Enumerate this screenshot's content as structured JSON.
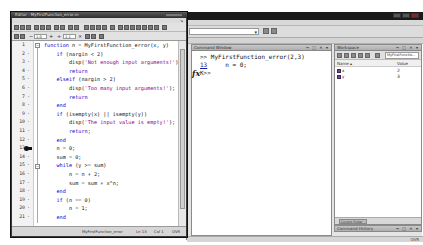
{
  "main_window": {
    "current_folder_placeholder": "",
    "command_window": {
      "title": "Command Window",
      "controls": "→ □ ✕ ▾",
      "lines": [
        {
          "prompt": ">> ",
          "text": "MyFirstFunction_error(2,3)"
        },
        {
          "link": "13",
          "text": "     n = 0;"
        },
        {
          "prompt": "K>>",
          "text": ""
        }
      ],
      "fx_label": "fx"
    },
    "workspace": {
      "title": "Workspace",
      "controls": "→ □ ✕ ▾",
      "stack_selector": "MyFirstFunctio...",
      "columns": {
        "name": "Name ▴",
        "value": "Value"
      },
      "variables": [
        {
          "name": "x",
          "value": "2"
        },
        {
          "name": "y",
          "value": "3"
        }
      ],
      "bottom_tab": "Current Folder"
    },
    "command_history": {
      "title": "Command History",
      "controls": "→ □ ✕ ▾"
    },
    "status": {
      "mode": "OVR"
    }
  },
  "editor": {
    "title": "Editor - MyFirstFunction_error.m",
    "menu": [
      "File",
      "Edit",
      "Text",
      "Go",
      "Cell",
      "Tools",
      "Debug",
      "Desktop",
      "Window",
      "Help"
    ],
    "cell_toolbar": {
      "minus": "−",
      "value1": "1.0",
      "plus": "+",
      "divide": "÷",
      "value2": "1.1",
      "times": "×"
    },
    "lines": [
      {
        "n": "1",
        "dash": "",
        "code": "function n = MyFirstFunction_error(x, y)"
      },
      {
        "n": "2",
        "dash": "-",
        "code": "    if (nargin < 2)"
      },
      {
        "n": "3",
        "dash": "-",
        "code": "        disp('Not enough input arguments!')"
      },
      {
        "n": "4",
        "dash": "-",
        "code": "        return"
      },
      {
        "n": "5",
        "dash": "-",
        "code": "    elseif (nargin > 2)"
      },
      {
        "n": "6",
        "dash": "-",
        "code": "        disp('Too many input arguments!');"
      },
      {
        "n": "7",
        "dash": "-",
        "code": "        return"
      },
      {
        "n": "8",
        "dash": "-",
        "code": "    end"
      },
      {
        "n": "9",
        "dash": "-",
        "code": "    if (isempty(x) || isempty(y))"
      },
      {
        "n": "10",
        "dash": "-",
        "code": "        disp('The input value is empty!');"
      },
      {
        "n": "11",
        "dash": "-",
        "code": "        return;"
      },
      {
        "n": "12",
        "dash": "-",
        "code": "    end"
      },
      {
        "n": "13",
        "dash": "",
        "code": "    n = 0;"
      },
      {
        "n": "14",
        "dash": "-",
        "code": "    sum = 0;"
      },
      {
        "n": "15",
        "dash": "-",
        "code": "    while (y >= sum)"
      },
      {
        "n": "16",
        "dash": "-",
        "code": "        n = n + 2;"
      },
      {
        "n": "17",
        "dash": "-",
        "code": "        sum = sum + x^n;"
      },
      {
        "n": "18",
        "dash": "-",
        "code": "    end"
      },
      {
        "n": "19",
        "dash": "-",
        "code": "    if (n == 0)"
      },
      {
        "n": "20",
        "dash": "-",
        "code": "        n = 1;"
      },
      {
        "n": "21",
        "dash": "-",
        "code": "    end"
      }
    ],
    "breakpoint_line": 13,
    "status": {
      "function": "MyFirstFunction_error",
      "ln": "Ln  13",
      "col": "Col  1",
      "mode": "OVR"
    }
  }
}
